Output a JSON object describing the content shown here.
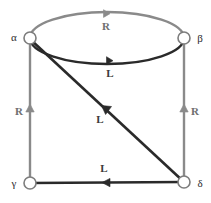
{
  "diagram": {
    "type": "labeled-directed-graph",
    "background_color": "#ffffff",
    "colors": {
      "edge_r": "#8a8a8a",
      "edge_l": "#2a2a2a",
      "node_stroke": "#7d7d7d",
      "node_fill": "#ffffff",
      "node_label": "#2b2b2b",
      "label_r": "#6f6f6f",
      "label_l": "#3a3a3a"
    },
    "nodes": [
      {
        "id": "alpha",
        "label": "α",
        "x": 30,
        "y": 38,
        "r": 6,
        "label_x": 14,
        "label_y": 38
      },
      {
        "id": "beta",
        "label": "β",
        "x": 184,
        "y": 38,
        "r": 6,
        "label_x": 199,
        "label_y": 40
      },
      {
        "id": "gamma",
        "label": "γ",
        "x": 30,
        "y": 183,
        "r": 6,
        "label_x": 14,
        "label_y": 184
      },
      {
        "id": "delta",
        "label": "δ",
        "x": 184,
        "y": 182,
        "r": 6,
        "label_x": 199,
        "label_y": 184
      }
    ],
    "edges": [
      {
        "id": "arc-top",
        "from": "beta",
        "to": "alpha",
        "label": "R",
        "style": "arc-upper",
        "color": "#8a8a8a",
        "label_x": 106,
        "label_y": 30,
        "arrow_x": 104,
        "arrow_y": 14
      },
      {
        "id": "arc-inner",
        "from": "beta",
        "to": "alpha",
        "label": "L",
        "style": "arc-lower",
        "color": "#2a2a2a",
        "label_x": 110,
        "label_y": 77,
        "arrow_x": 110,
        "arrow_y": 61
      },
      {
        "id": "edge-left",
        "from": "gamma",
        "to": "alpha",
        "label": "R",
        "style": "straight-vertical",
        "color": "#8a8a8a",
        "label_x": 19,
        "label_y": 115,
        "arrow_x": 30,
        "arrow_y": 110
      },
      {
        "id": "edge-right",
        "from": "delta",
        "to": "beta",
        "label": "R",
        "style": "straight-vertical",
        "color": "#8a8a8a",
        "label_x": 195,
        "label_y": 115,
        "arrow_x": 184,
        "arrow_y": 110
      },
      {
        "id": "edge-bottom",
        "from": "delta",
        "to": "gamma",
        "label": "L",
        "style": "straight-horizontal",
        "color": "#2a2a2a",
        "label_x": 104,
        "label_y": 172,
        "arrow_x": 106,
        "arrow_y": 183
      },
      {
        "id": "edge-diagonal",
        "from": "delta",
        "to": "alpha",
        "label": "L",
        "style": "straight-diagonal",
        "color": "#2a2a2a",
        "label_x": 100,
        "label_y": 123,
        "arrow_x": 104,
        "arrow_y": 110
      }
    ]
  }
}
